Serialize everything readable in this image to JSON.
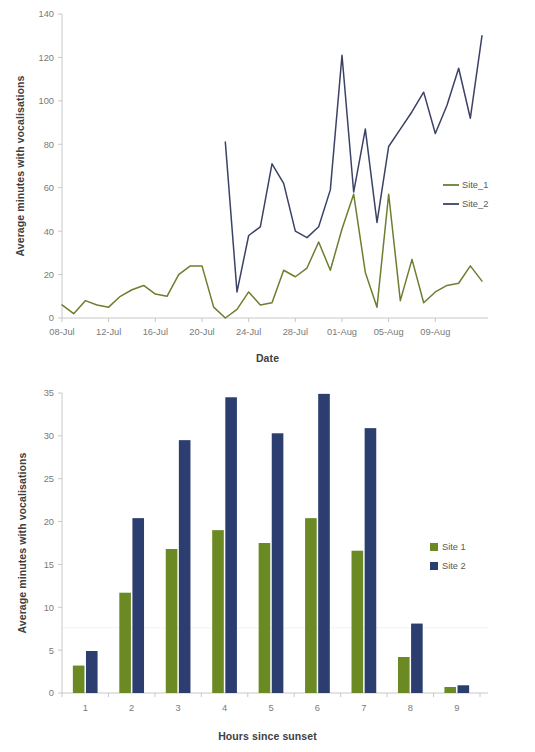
{
  "chart_data": [
    {
      "type": "line",
      "id": "line-chart",
      "title": "",
      "xlabel": "Date",
      "ylabel": "Average minutes with vocalisations",
      "ylim": [
        0,
        140
      ],
      "yticks": [
        0,
        20,
        40,
        60,
        80,
        100,
        120,
        140
      ],
      "ytick_labels": [
        "0",
        "20",
        "40",
        "60",
        "80",
        "100",
        "120",
        "140"
      ],
      "grid": false,
      "legend_position": "right",
      "x": [
        "08-Jul",
        "09-Jul",
        "10-Jul",
        "11-Jul",
        "12-Jul",
        "13-Jul",
        "14-Jul",
        "15-Jul",
        "16-Jul",
        "17-Jul",
        "18-Jul",
        "19-Jul",
        "20-Jul",
        "21-Jul",
        "22-Jul",
        "23-Jul",
        "24-Jul",
        "25-Jul",
        "26-Jul",
        "27-Jul",
        "28-Jul",
        "29-Jul",
        "30-Jul",
        "31-Jul",
        "01-Aug",
        "02-Aug",
        "03-Aug",
        "04-Aug",
        "05-Aug",
        "06-Aug",
        "07-Aug",
        "08-Aug",
        "09-Aug",
        "10-Aug",
        "11-Aug"
      ],
      "xtick_labels": [
        "08-Jul",
        "12-Jul",
        "16-Jul",
        "20-Jul",
        "24-Jul",
        "28-Jul",
        "01-Aug",
        "05-Aug",
        "09-Aug"
      ],
      "xtick_positions": [
        0,
        4,
        8,
        12,
        16,
        20,
        24,
        28,
        32
      ],
      "series": [
        {
          "name": "Site_1",
          "color": "#6b7f2e",
          "values": [
            6,
            2,
            8,
            6,
            5,
            10,
            13,
            15,
            11,
            10,
            20,
            24,
            24,
            5,
            0,
            4,
            12,
            6,
            7,
            22,
            19,
            23,
            35,
            22,
            41,
            57,
            21,
            5,
            57,
            8,
            27,
            7,
            12,
            15,
            16,
            24,
            17
          ]
        },
        {
          "name": "Site_2",
          "color": "#3b4266",
          "values": [
            null,
            null,
            null,
            null,
            null,
            null,
            null,
            null,
            null,
            null,
            null,
            null,
            null,
            null,
            81,
            12,
            38,
            42,
            71,
            62,
            40,
            37,
            42,
            59,
            121,
            58,
            87,
            44,
            79,
            87,
            95,
            104,
            85,
            98,
            115,
            92,
            130
          ]
        }
      ]
    },
    {
      "type": "bar",
      "id": "bar-chart",
      "title": "",
      "xlabel": "Hours since sunset",
      "ylabel": "Average  minutes with vocalisations",
      "ylim": [
        0,
        35
      ],
      "yticks": [
        0,
        5,
        10,
        15,
        20,
        25,
        30,
        35
      ],
      "ytick_labels": [
        "0",
        "5",
        "10",
        "15",
        "20",
        "25",
        "30",
        "35"
      ],
      "grid": false,
      "legend_position": "right",
      "categories": [
        "1",
        "2",
        "3",
        "4",
        "5",
        "6",
        "7",
        "8",
        "9"
      ],
      "series": [
        {
          "name": "Site 1",
          "color": "#6b8a23",
          "values": [
            3.2,
            11.7,
            16.8,
            19.0,
            17.5,
            20.4,
            16.6,
            4.2,
            0.7
          ]
        },
        {
          "name": "Site 2",
          "color": "#2c3e70",
          "values": [
            4.9,
            20.4,
            29.5,
            34.5,
            30.3,
            34.9,
            30.9,
            8.1,
            0.9
          ]
        }
      ]
    }
  ],
  "colors": {
    "site1_line": "#6b7f2e",
    "site2_line": "#3b4266",
    "site1_bar": "#6b8a23",
    "site2_bar": "#2c3e70",
    "axis": "#c8c8c8",
    "tick_text": "#7a7a7a",
    "title_text": "#404040",
    "background": "#ffffff"
  },
  "line_chart": {
    "ylabel": "Average minutes with vocalisations",
    "xlabel": "Date",
    "legend": [
      {
        "label": "Site_1"
      },
      {
        "label": "Site_2"
      }
    ]
  },
  "bar_chart": {
    "ylabel": "Average  minutes with vocalisations",
    "xlabel": "Hours since sunset",
    "legend": [
      {
        "label": "Site 1"
      },
      {
        "label": "Site 2"
      }
    ]
  }
}
